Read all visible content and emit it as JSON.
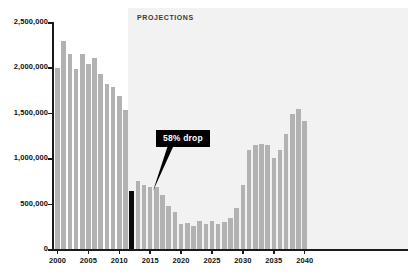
{
  "chart_data": {
    "type": "bar",
    "title": "",
    "subtitle": "",
    "xlabel": "",
    "ylabel": "",
    "ylim": [
      0,
      2500000
    ],
    "xlim": [
      1999.4,
      2040.6
    ],
    "grid": false,
    "legend": null,
    "y_ticks": [
      0,
      500000,
      1000000,
      1500000,
      2000000,
      2500000
    ],
    "y_tick_labels": [
      "0",
      "500,000",
      "1,000,000",
      "1,500,000",
      "2,000,000",
      "2,500,000"
    ],
    "x_ticks": [
      2000,
      2005,
      2010,
      2015,
      2020,
      2025,
      2030,
      2035,
      2040
    ],
    "x_tick_labels": [
      "2000",
      "2005",
      "2010",
      "2015",
      "2020",
      "2025",
      "2030",
      "2035",
      "2040"
    ],
    "categories": [
      "2000",
      "2001",
      "2002",
      "2003",
      "2004",
      "2005",
      "2006",
      "2007",
      "2008",
      "2009",
      "2010",
      "2011",
      "2012",
      "2013",
      "2014",
      "2015",
      "2016",
      "2017",
      "2018",
      "2019",
      "2020",
      "2021",
      "2022",
      "2023",
      "2024",
      "2025",
      "2026",
      "2027",
      "2028",
      "2029",
      "2030",
      "2031",
      "2032",
      "2033",
      "2034",
      "2035",
      "2036",
      "2037",
      "2038",
      "2039",
      "2040"
    ],
    "values": [
      1990000,
      2295000,
      2150000,
      1985000,
      2150000,
      2035000,
      2100000,
      1925000,
      1815000,
      1785000,
      1690000,
      1530000,
      640000,
      745000,
      700000,
      680000,
      680000,
      600000,
      470000,
      405000,
      275000,
      290000,
      255000,
      305000,
      270000,
      310000,
      275000,
      300000,
      345000,
      455000,
      700000,
      1085000,
      1145000,
      1160000,
      1145000,
      1000000,
      1090000,
      1265000,
      1485000,
      1540000,
      1405000
    ],
    "bar_colors": {
      "historical": "#b2b2b2",
      "projection": "#b2b2b2",
      "highlight": "#0a0a0a"
    },
    "highlight_category": "2012",
    "projection_start_category": "2012",
    "shaded_region": {
      "label": "PROJECTIONS",
      "from": "2012",
      "to": "2040",
      "color": "#f2f2f2"
    },
    "annotations": [
      {
        "text": "58% drop",
        "points_to_category": "2012",
        "style": "black-callout-box",
        "text_color": "#ffffff",
        "background": "#000000"
      }
    ]
  },
  "axes": {
    "y_axis_color": "#1a1a1a",
    "x_axis_color": "#1a1a1a",
    "tick_label_color": "#111111"
  },
  "labels": {
    "projections": "PROJECTIONS",
    "callout": "58% drop"
  }
}
